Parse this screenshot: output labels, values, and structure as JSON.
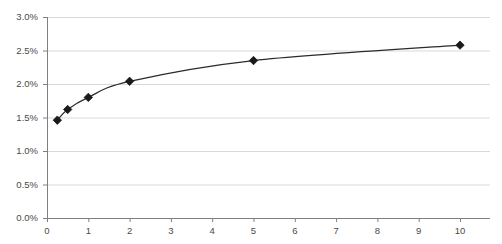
{
  "chart_data": {
    "type": "line",
    "title": "",
    "subtitle": "",
    "xlabel": "",
    "ylabel": "",
    "xlim": [
      0,
      10.6
    ],
    "ylim": [
      0,
      3.0
    ],
    "grid": true,
    "grid_axis": "y",
    "legend": false,
    "legend_position": "none",
    "marker": "diamond",
    "line_color": "#2b2b2b",
    "marker_color": "#1a1a1a",
    "grid_color": "#d9d9d9",
    "axis_color": "#808080",
    "x_ticks": [
      0,
      1,
      2,
      3,
      4,
      5,
      6,
      7,
      8,
      9,
      10
    ],
    "x_tick_labels": [
      "0",
      "1",
      "2",
      "3",
      "4",
      "5",
      "6",
      "7",
      "8",
      "9",
      "10"
    ],
    "y_ticks": [
      0.0,
      0.5,
      1.0,
      1.5,
      2.0,
      2.5,
      3.0
    ],
    "y_tick_labels": [
      "0.0%",
      "0.5%",
      "1.0%",
      "1.5%",
      "2.0%",
      "2.5%",
      "3.0%"
    ],
    "series": [
      {
        "name": "series-1",
        "points": [
          {
            "x": 0.25,
            "y": 1.46
          },
          {
            "x": 0.5,
            "y": 1.62
          },
          {
            "x": 1.0,
            "y": 1.8
          },
          {
            "x": 2.0,
            "y": 2.04
          },
          {
            "x": 5.0,
            "y": 2.35
          },
          {
            "x": 10.0,
            "y": 2.58
          }
        ]
      }
    ]
  }
}
